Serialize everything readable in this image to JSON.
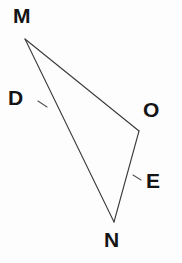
{
  "figure": {
    "kind": "geometry-diagram",
    "background_color": "#fdfdfd",
    "stroke_color": "#3a3a3a",
    "label_color": "#141414",
    "stroke_width": 1.1,
    "canvas": {
      "width": 182,
      "height": 263
    },
    "labels": [
      {
        "id": "M",
        "text": "M",
        "x": 13,
        "y": 5
      },
      {
        "id": "D",
        "text": "D",
        "x": 8,
        "y": 87
      },
      {
        "id": "O",
        "text": "O",
        "x": 143,
        "y": 99
      },
      {
        "id": "E",
        "text": "E",
        "x": 146,
        "y": 170
      },
      {
        "id": "N",
        "text": "N",
        "x": 104,
        "y": 229
      }
    ],
    "vertices": [
      {
        "id": "M",
        "x": 25,
        "y": 39
      },
      {
        "id": "O",
        "x": 139,
        "y": 131
      },
      {
        "id": "N",
        "x": 114,
        "y": 222
      }
    ],
    "segments": [
      {
        "id": "MO",
        "from": "M",
        "to": "O",
        "x1": 25,
        "y1": 39,
        "x2": 139,
        "y2": 131
      },
      {
        "id": "MN",
        "from": "M",
        "to": "N",
        "x1": 25,
        "y1": 39,
        "x2": 114,
        "y2": 222
      },
      {
        "id": "ON",
        "from": "O",
        "to": "N",
        "x1": 139,
        "y1": 131,
        "x2": 114,
        "y2": 222
      }
    ],
    "tick_marks": [
      {
        "id": "tick-D",
        "on_segment": "MN",
        "near_label": "D",
        "x1": 38,
        "y1": 101,
        "x2": 47,
        "y2": 107
      },
      {
        "id": "tick-E",
        "on_segment": "ON",
        "near_label": "E",
        "x1": 133,
        "y1": 175,
        "x2": 141,
        "y2": 180
      }
    ]
  }
}
